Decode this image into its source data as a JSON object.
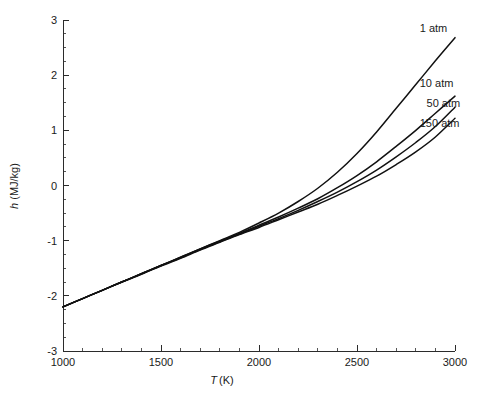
{
  "chart_data": {
    "type": "line",
    "title": "",
    "xlabel": "T (K)",
    "xlabel_symbol": "T",
    "xlabel_unit": "(K)",
    "ylabel": "h (MJ/kg)",
    "ylabel_symbol": "h",
    "ylabel_unit": "(MJ/kg)",
    "xlim": [
      1000,
      3000
    ],
    "ylim": [
      -3,
      3
    ],
    "x_major_ticks": [
      1000,
      1500,
      2000,
      2500,
      3000
    ],
    "x_tick_labels": [
      "1000",
      "1500",
      "2000",
      "2500",
      "3000"
    ],
    "x_minor_interval": 100,
    "y_major_ticks": [
      -3,
      -2,
      -1,
      0,
      1,
      2,
      3
    ],
    "y_tick_labels": [
      "-3",
      "-2",
      "-1",
      "0",
      "1",
      "2",
      "3"
    ],
    "y_minor_interval": 0.25,
    "grid": false,
    "legend": "inline-labels-right",
    "line_color": "#111111",
    "axis_color": "#2b2b2b",
    "x": [
      1000,
      1100,
      1200,
      1300,
      1400,
      1500,
      1600,
      1700,
      1800,
      1900,
      2000,
      2100,
      2200,
      2300,
      2400,
      2500,
      2600,
      2700,
      2800,
      2900,
      3000
    ],
    "series": [
      {
        "name": "1 atm",
        "label": "1 atm",
        "label_x": 2820,
        "label_y": 2.78,
        "values": [
          -2.2,
          -2.05,
          -1.9,
          -1.75,
          -1.6,
          -1.45,
          -1.3,
          -1.15,
          -1.0,
          -0.85,
          -0.68,
          -0.5,
          -0.29,
          -0.05,
          0.24,
          0.58,
          0.97,
          1.4,
          1.83,
          2.26,
          2.68
        ]
      },
      {
        "name": "10 atm",
        "label": "10 atm",
        "label_x": 2820,
        "label_y": 1.78,
        "values": [
          -2.2,
          -2.05,
          -1.9,
          -1.75,
          -1.6,
          -1.45,
          -1.3,
          -1.15,
          -1.01,
          -0.87,
          -0.72,
          -0.57,
          -0.41,
          -0.24,
          -0.04,
          0.18,
          0.43,
          0.71,
          1.0,
          1.31,
          1.62
        ]
      },
      {
        "name": "50 atm",
        "label": "50 atm",
        "label_x": 2855,
        "label_y": 1.42,
        "values": [
          -2.2,
          -2.05,
          -1.9,
          -1.75,
          -1.6,
          -1.45,
          -1.31,
          -1.16,
          -1.02,
          -0.88,
          -0.74,
          -0.6,
          -0.45,
          -0.29,
          -0.12,
          0.07,
          0.28,
          0.52,
          0.78,
          1.07,
          1.42
        ]
      },
      {
        "name": "150 atm",
        "label": "150 atm",
        "label_x": 2820,
        "label_y": 1.06,
        "values": [
          -2.2,
          -2.05,
          -1.9,
          -1.75,
          -1.61,
          -1.46,
          -1.32,
          -1.17,
          -1.03,
          -0.89,
          -0.76,
          -0.62,
          -0.48,
          -0.34,
          -0.18,
          -0.01,
          0.17,
          0.38,
          0.61,
          0.88,
          1.22
        ]
      }
    ]
  }
}
